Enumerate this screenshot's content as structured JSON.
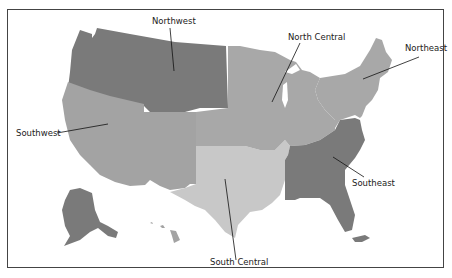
{
  "map": {
    "title": "",
    "regions": [
      {
        "id": "northwest",
        "label": "Northwest",
        "color": "#7a7a7a"
      },
      {
        "id": "north-central",
        "label": "North Central",
        "color": "#a8a8a8"
      },
      {
        "id": "northeast",
        "label": "Northeast",
        "color": "#a8a8a8"
      },
      {
        "id": "southwest",
        "label": "Southwest",
        "color": "#a3a3a3"
      },
      {
        "id": "south-central",
        "label": "South Central",
        "color": "#c8c8c8"
      },
      {
        "id": "southeast",
        "label": "Southeast",
        "color": "#7a7a7a"
      }
    ],
    "labels": {
      "northwest": "Northwest",
      "north_central": "North Central",
      "northeast": "Northeast",
      "southwest": "Southwest",
      "south_central": "South Central",
      "southeast": "Southeast"
    }
  }
}
